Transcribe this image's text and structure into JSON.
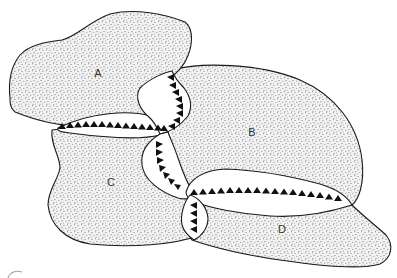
{
  "diagram": {
    "colors": {
      "background": "#ffffff",
      "plate_fill_dots": "#6b6b6b",
      "outline": "#1a1a1a",
      "teeth": "#111111"
    },
    "plates": [
      {
        "id": "A",
        "label": "A",
        "label_pos": [
          98,
          73
        ]
      },
      {
        "id": "B",
        "label": "B",
        "label_pos": [
          252,
          132
        ]
      },
      {
        "id": "C",
        "label": "C",
        "label_pos": [
          111,
          182
        ]
      },
      {
        "id": "D",
        "label": "D",
        "label_pos": [
          282,
          229
        ]
      }
    ],
    "boundaries": [
      {
        "name": "A-C subduction zone",
        "orientation": "horizontal",
        "teeth": 14
      },
      {
        "name": "A-B subduction zone",
        "orientation": "vertical",
        "teeth": 8
      },
      {
        "name": "B-C subduction zone",
        "orientation": "vertical",
        "teeth": 7
      },
      {
        "name": "B-D subduction zone",
        "orientation": "horizontal",
        "teeth": 17
      },
      {
        "name": "C-D subduction zone",
        "orientation": "vertical",
        "teeth": 4
      }
    ]
  }
}
